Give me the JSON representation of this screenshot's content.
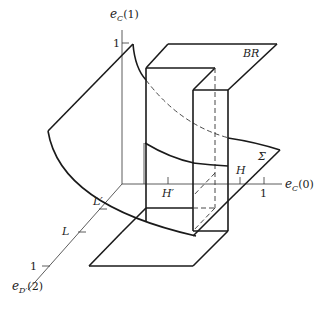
{
  "diagram": {
    "axes": {
      "vertical": {
        "label_main": "e",
        "label_sub": "C",
        "label_arg": "(1)",
        "tick_label": "1"
      },
      "horizontal": {
        "label_main": "e",
        "label_sub": "C",
        "label_arg": "(0)",
        "tick_labels": {
          "h_prime": "H′",
          "h": "H",
          "one": "1"
        }
      },
      "diagonal": {
        "label_main": "e",
        "label_sub": "D′",
        "label_arg": "(2)",
        "tick_labels": {
          "l_prime": "L′",
          "l": "L",
          "one": "1"
        }
      }
    },
    "surfaces": {
      "br_label": "BR",
      "sigma_label": "Σ"
    }
  }
}
